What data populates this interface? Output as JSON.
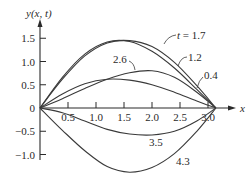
{
  "chart_data": {
    "type": "line",
    "title": "",
    "xlabel": "x",
    "ylabel": "y(x, t)",
    "xlim": [
      0,
      3.1416
    ],
    "ylim": [
      -1.25,
      1.75
    ],
    "grid": false,
    "legend": "none (curves labeled inline)",
    "x_ticks": [
      0.5,
      1.0,
      1.5,
      2.0,
      2.5,
      3.0
    ],
    "x_tick_labels": [
      "0.5",
      "1.0",
      "1.5",
      "2.0",
      "2.5",
      "3.0"
    ],
    "y_ticks": [
      -1.0,
      -0.5,
      0,
      0.5,
      1.0,
      1.5
    ],
    "y_tick_labels": [
      "−1.0",
      "−0.5",
      "0",
      "0.5",
      "1.0",
      "1.5"
    ],
    "series": [
      {
        "name": "t = 1.7",
        "label": "t = 1.7",
        "x": [
          0,
          0.4,
          0.8,
          1.2,
          1.6,
          2.0,
          2.4,
          2.8,
          3.1416
        ],
        "y": [
          0,
          0.62,
          1.12,
          1.4,
          1.45,
          1.32,
          0.98,
          0.48,
          0
        ]
      },
      {
        "name": "t = 1.2",
        "label": "1.2",
        "x": [
          0,
          0.4,
          0.8,
          1.2,
          1.6,
          2.0,
          2.4,
          2.8,
          3.1416
        ],
        "y": [
          0,
          0.66,
          1.16,
          1.42,
          1.43,
          1.22,
          0.86,
          0.4,
          0
        ]
      },
      {
        "name": "t = 2.6",
        "label": "2.6",
        "x": [
          0,
          0.4,
          0.8,
          1.2,
          1.6,
          2.0,
          2.4,
          2.8,
          3.1416
        ],
        "y": [
          0,
          0.2,
          0.42,
          0.62,
          0.76,
          0.8,
          0.66,
          0.34,
          0
        ]
      },
      {
        "name": "t = 0.4",
        "label": "0.4",
        "x": [
          0,
          0.4,
          0.8,
          1.2,
          1.6,
          2.0,
          2.4,
          2.8,
          3.1416
        ],
        "y": [
          0,
          0.3,
          0.52,
          0.62,
          0.6,
          0.5,
          0.34,
          0.15,
          0
        ]
      },
      {
        "name": "t = 3.5",
        "label": "3.5",
        "x": [
          0,
          0.4,
          0.8,
          1.2,
          1.6,
          2.0,
          2.4,
          2.8,
          3.1416
        ],
        "y": [
          0,
          -0.1,
          -0.28,
          -0.46,
          -0.56,
          -0.58,
          -0.5,
          -0.28,
          0
        ]
      },
      {
        "name": "t = 4.3",
        "label": "4.3",
        "x": [
          0,
          0.4,
          0.8,
          1.2,
          1.6,
          2.0,
          2.4,
          2.8,
          3.1416
        ],
        "y": [
          0,
          -0.48,
          -0.92,
          -1.26,
          -1.38,
          -1.28,
          -0.98,
          -0.5,
          0
        ]
      }
    ]
  },
  "labels": {
    "y_axis": "y(x, t)",
    "x_axis": "x",
    "curve_t17": "t = 1.7",
    "curve_t12": "1.2",
    "curve_t26": "2.6",
    "curve_t04": "0.4",
    "curve_t35": "3.5",
    "curve_t43": "4.3"
  }
}
